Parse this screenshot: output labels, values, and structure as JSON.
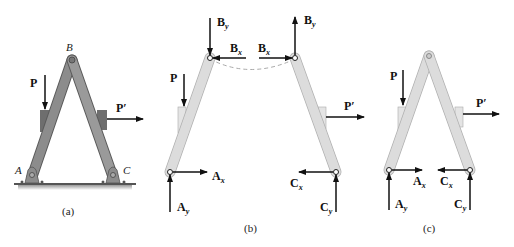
{
  "figure": {
    "panels": [
      {
        "id": "a",
        "caption": "(a)",
        "points": {
          "A": "A",
          "B": "B",
          "C": "C"
        },
        "loads": {
          "P": "P",
          "P_prime": "P′"
        }
      },
      {
        "id": "b",
        "caption": "(b)",
        "left_member": {
          "By": "B",
          "By_sub": "y",
          "Bx": "B",
          "Bx_sub": "x",
          "P": "P",
          "Ax": "A",
          "Ax_sub": "x",
          "Ay": "A",
          "Ay_sub": "y"
        },
        "right_member": {
          "By": "B",
          "By_sub": "y",
          "Bx": "B",
          "Bx_sub": "x",
          "P_prime": "P′",
          "Cx": "C",
          "Cx_sub": "x",
          "Cy": "C",
          "Cy_sub": "y"
        }
      },
      {
        "id": "c",
        "caption": "(c)",
        "loads": {
          "P": "P",
          "P_prime": "P′",
          "Ax": "A",
          "Ax_sub": "x",
          "Ay": "A",
          "Ay_sub": "y",
          "Cx": "C",
          "Cx_sub": "x",
          "Cy": "C",
          "Cy_sub": "y"
        }
      }
    ],
    "colors": {
      "member_dark": "#8c8c8c",
      "member_light": "#dcdcdc",
      "block_dark": "#6e6e6e",
      "block_light": "#c8c8c8",
      "arrow": "#111111",
      "ground": "#555555"
    }
  }
}
